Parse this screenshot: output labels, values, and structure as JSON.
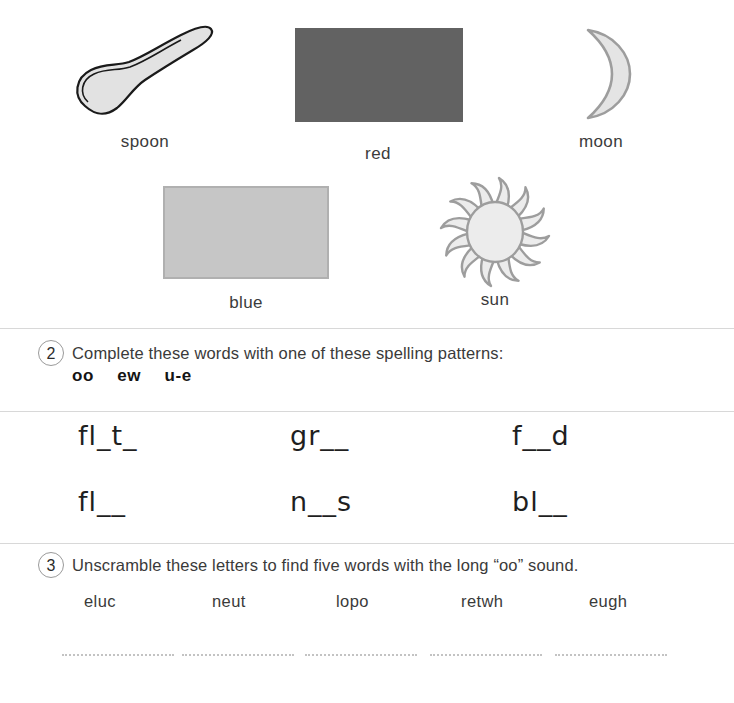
{
  "worksheet": {
    "picture_items": [
      {
        "label": "spoon",
        "icon": "spoon-illustration"
      },
      {
        "label": "red",
        "icon": "color-swatch-red"
      },
      {
        "label": "moon",
        "icon": "crescent-moon-illustration"
      },
      {
        "label": "blue",
        "icon": "color-swatch-blue"
      },
      {
        "label": "sun",
        "icon": "sun-illustration"
      }
    ],
    "colors": {
      "red_swatch": "#626262",
      "blue_swatch": "#c6c6c6",
      "blue_swatch_border": "#b0b0b0",
      "rule": "#d8d8d8",
      "text": "#3a3a3a",
      "heading_text": "#1f1f1f",
      "dotted_line": "#c3c3c3"
    },
    "task2": {
      "number": "2",
      "instruction": "Complete these words with one of these spelling patterns:",
      "patterns": [
        "oo",
        "ew",
        "u-e"
      ],
      "word_rows": [
        [
          "fl_t_",
          "gr__",
          "f__d"
        ],
        [
          "fl__",
          "n__s",
          "bl__"
        ]
      ]
    },
    "task3": {
      "number": "3",
      "instruction": "Unscramble these letters to find five words with the long “oo” sound.",
      "scrambled_words": [
        "eluc",
        "neut",
        "lopo",
        "retwh",
        "eugh"
      ],
      "answer_lines": [
        "",
        "",
        "",
        "",
        ""
      ]
    }
  }
}
